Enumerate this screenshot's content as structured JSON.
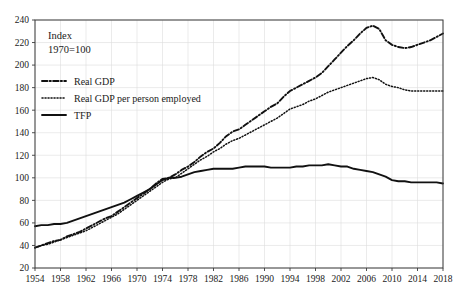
{
  "chart_data": {
    "type": "line",
    "title": "",
    "subtitle": "",
    "annotation_line1": "Index",
    "annotation_line2": "1970=100",
    "xlabel": "",
    "ylabel": "",
    "xlim": [
      1954,
      2018
    ],
    "ylim": [
      20,
      240
    ],
    "ytick_step": 20,
    "xtick_step": 4,
    "grid": true,
    "legend_position": "upper-left-inside",
    "yticks": [
      20,
      40,
      60,
      80,
      100,
      120,
      140,
      160,
      180,
      200,
      220,
      240
    ],
    "xticks": [
      1954,
      1958,
      1962,
      1966,
      1970,
      1974,
      1978,
      1982,
      1986,
      1990,
      1994,
      1998,
      2002,
      2006,
      2010,
      2014,
      2018
    ],
    "x": [
      1954,
      1955,
      1956,
      1957,
      1958,
      1959,
      1960,
      1961,
      1962,
      1963,
      1964,
      1965,
      1966,
      1967,
      1968,
      1969,
      1970,
      1971,
      1972,
      1973,
      1974,
      1975,
      1976,
      1977,
      1978,
      1979,
      1980,
      1981,
      1982,
      1983,
      1984,
      1985,
      1986,
      1987,
      1988,
      1989,
      1990,
      1991,
      1992,
      1993,
      1994,
      1995,
      1996,
      1997,
      1998,
      1999,
      2000,
      2001,
      2002,
      2003,
      2004,
      2005,
      2006,
      2007,
      2008,
      2009,
      2010,
      2011,
      2012,
      2013,
      2014,
      2015,
      2016,
      2017,
      2018
    ],
    "series": [
      {
        "name": "Real GDP",
        "style": "dash-dot",
        "color": "#111111",
        "values": [
          38,
          40,
          42,
          44,
          45,
          48,
          50,
          52,
          55,
          58,
          61,
          64,
          66,
          70,
          74,
          78,
          82,
          86,
          90,
          95,
          99,
          100,
          103,
          107,
          110,
          114,
          119,
          123,
          126,
          131,
          137,
          141,
          143,
          147,
          151,
          155,
          159,
          163,
          166,
          172,
          177,
          180,
          183,
          186,
          189,
          193,
          199,
          205,
          211,
          217,
          222,
          228,
          233,
          235,
          232,
          222,
          218,
          216,
          215,
          216,
          218,
          220,
          222,
          225,
          228
        ]
      },
      {
        "name": "Real GDP per person employed",
        "style": "dotted",
        "color": "#111111",
        "values": [
          38,
          40,
          41,
          43,
          45,
          47,
          49,
          51,
          53,
          56,
          59,
          62,
          65,
          68,
          72,
          76,
          80,
          84,
          88,
          92,
          96,
          99,
          100,
          104,
          108,
          112,
          116,
          119,
          123,
          126,
          130,
          133,
          135,
          138,
          141,
          144,
          147,
          150,
          153,
          157,
          161,
          163,
          165,
          168,
          170,
          173,
          176,
          178,
          180,
          182,
          184,
          186,
          188,
          189,
          187,
          183,
          181,
          180,
          178,
          177,
          177,
          177,
          177,
          177,
          177
        ]
      },
      {
        "name": "TFP",
        "style": "solid",
        "color": "#111111",
        "values": [
          57,
          58,
          58,
          59,
          59,
          60,
          62,
          64,
          66,
          68,
          70,
          72,
          74,
          76,
          78,
          81,
          84,
          87,
          90,
          94,
          98,
          100,
          100,
          101,
          103,
          105,
          106,
          107,
          108,
          108,
          108,
          108,
          109,
          110,
          110,
          110,
          110,
          109,
          109,
          109,
          109,
          110,
          110,
          111,
          111,
          111,
          112,
          111,
          110,
          110,
          108,
          107,
          106,
          105,
          103,
          101,
          98,
          97,
          97,
          96,
          96,
          96,
          96,
          96,
          95
        ]
      }
    ]
  },
  "legend": {
    "items": [
      {
        "label": "Real GDP",
        "style": "dash-dot"
      },
      {
        "label": "Real GDP per person employed",
        "style": "dotted"
      },
      {
        "label": "TFP",
        "style": "solid"
      }
    ]
  }
}
